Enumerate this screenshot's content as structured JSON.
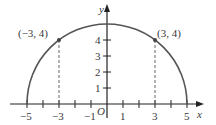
{
  "diagram": {
    "type": "semicircle-graph",
    "equation_radius": 5,
    "axes": {
      "x_label": "x",
      "y_label": "y",
      "origin_label": "O",
      "x_ticks": [
        -5,
        -4,
        -3,
        -2,
        -1,
        1,
        2,
        3,
        4,
        5
      ],
      "x_tick_labels": [
        {
          "value": -5,
          "text": "−5"
        },
        {
          "value": -3,
          "text": "−3"
        },
        {
          "value": -1,
          "text": "−1"
        },
        {
          "value": 1,
          "text": "1"
        },
        {
          "value": 3,
          "text": "3"
        },
        {
          "value": 5,
          "text": "5"
        }
      ],
      "y_ticks": [
        1,
        2,
        3,
        4
      ],
      "y_tick_labels": [
        {
          "value": 1,
          "text": "1"
        },
        {
          "value": 2,
          "text": "2"
        },
        {
          "value": 3,
          "text": "3"
        },
        {
          "value": 4,
          "text": "4"
        }
      ]
    },
    "points": [
      {
        "x": -3,
        "y": 4,
        "label": "(−3, 4)"
      },
      {
        "x": 3,
        "y": 4,
        "label": "(3, 4)"
      }
    ],
    "colors": {
      "curve": "#555555",
      "axis": "#222222",
      "dashed": "#666666",
      "text": "#3a3a3a"
    }
  }
}
